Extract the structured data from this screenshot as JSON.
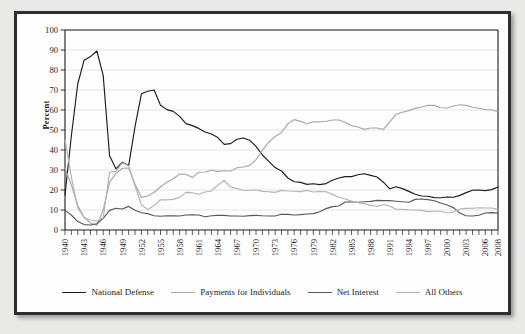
{
  "figure": {
    "y_axis_title": "Percent",
    "background_color": "#e9e9e7",
    "plate_color": "#ffffff",
    "frame_color": "#2e2e2e"
  },
  "legend": {
    "position": "bottom",
    "items": [
      {
        "label": "National Defense",
        "color": "#1d1d1d"
      },
      {
        "label": "Payments for Individuals",
        "color": "#a8a8a8"
      },
      {
        "label": "Net Interest",
        "color": "#595959"
      },
      {
        "label": "All Others",
        "color": "#b4b4b4"
      }
    ]
  },
  "chart_data": {
    "type": "line",
    "title": "",
    "subtitle": "",
    "xlabel": "",
    "ylabel": "Percent",
    "xlim": [
      1940,
      2008
    ],
    "ylim": [
      0,
      100
    ],
    "ytick_step": 10,
    "grid": true,
    "y_ticks": [
      0,
      10,
      20,
      30,
      40,
      50,
      60,
      70,
      80,
      90,
      100
    ],
    "x_tick_labels": [
      "1940",
      "1943",
      "1946",
      "1949",
      "1952",
      "1955",
      "1958",
      "1961",
      "1964",
      "1967",
      "1970",
      "1973",
      "1976",
      "1979",
      "1982",
      "1985",
      "1988",
      "1991",
      "1994",
      "1997",
      "2000",
      "2003",
      "2006",
      "2008"
    ],
    "x_minor_ticks_every_year": true,
    "x": [
      1940,
      1941,
      1942,
      1943,
      1944,
      1945,
      1946,
      1947,
      1948,
      1949,
      1950,
      1951,
      1952,
      1953,
      1954,
      1955,
      1956,
      1957,
      1958,
      1959,
      1960,
      1961,
      1962,
      1963,
      1964,
      1965,
      1966,
      1967,
      1968,
      1969,
      1970,
      1971,
      1972,
      1973,
      1974,
      1975,
      1976,
      1977,
      1978,
      1979,
      1980,
      1981,
      1982,
      1983,
      1984,
      1985,
      1986,
      1987,
      1988,
      1989,
      1990,
      1991,
      1992,
      1993,
      1994,
      1995,
      1996,
      1997,
      1998,
      1999,
      2000,
      2001,
      2002,
      2003,
      2004,
      2005,
      2006,
      2007,
      2008
    ],
    "series": [
      {
        "name": "National Defense",
        "color": "#1d1d1d",
        "values": [
          17.5,
          47.1,
          73.0,
          84.9,
          86.7,
          89.5,
          77.3,
          37.1,
          30.6,
          33.9,
          32.2,
          51.8,
          68.1,
          69.4,
          70.0,
          62.4,
          60.2,
          59.3,
          56.8,
          53.2,
          52.2,
          50.8,
          49.0,
          48.0,
          46.2,
          42.8,
          43.2,
          45.4,
          46.0,
          44.9,
          41.8,
          37.5,
          34.3,
          31.2,
          29.5,
          26.0,
          24.1,
          23.8,
          22.8,
          23.1,
          22.7,
          23.2,
          24.9,
          26.0,
          26.7,
          26.7,
          27.6,
          28.1,
          27.3,
          26.5,
          23.9,
          20.6,
          21.6,
          20.7,
          19.3,
          17.9,
          17.0,
          16.9,
          16.2,
          16.1,
          16.5,
          16.4,
          17.3,
          18.7,
          19.9,
          20.0,
          19.7,
          20.2,
          21.5
        ]
      },
      {
        "name": "Payments for Individuals",
        "color": "#a8a8a8",
        "values": [
          30.9,
          22.5,
          12.3,
          6.4,
          3.5,
          2.3,
          10.1,
          23.8,
          28.3,
          30.9,
          31.0,
          23.0,
          16.3,
          17.0,
          18.9,
          21.6,
          23.9,
          25.6,
          28.0,
          27.9,
          26.2,
          28.9,
          29.0,
          29.9,
          29.3,
          29.6,
          29.5,
          31.1,
          31.5,
          32.3,
          35.1,
          39.8,
          43.9,
          46.8,
          48.8,
          53.1,
          55.2,
          54.3,
          53.1,
          54.1,
          54.1,
          54.4,
          55.0,
          55.0,
          53.9,
          52.2,
          51.5,
          50.3,
          51.0,
          51.0,
          50.3,
          54.1,
          57.9,
          58.9,
          59.7,
          60.8,
          61.5,
          62.4,
          62.3,
          61.1,
          61.0,
          62.0,
          62.6,
          62.3,
          61.4,
          60.9,
          60.2,
          60.1,
          59.2
        ]
      },
      {
        "name": "Net Interest",
        "color": "#595959",
        "values": [
          9.8,
          7.5,
          4.2,
          2.7,
          2.5,
          3.1,
          5.8,
          9.8,
          10.9,
          10.5,
          11.8,
          9.9,
          8.6,
          8.2,
          7.1,
          6.9,
          7.1,
          7.1,
          7.0,
          7.5,
          7.6,
          7.5,
          6.6,
          7.1,
          7.3,
          7.3,
          7.0,
          7.0,
          6.9,
          7.2,
          7.3,
          7.1,
          7.0,
          7.0,
          7.9,
          7.8,
          7.5,
          7.7,
          8.0,
          8.2,
          9.1,
          10.7,
          11.7,
          12.0,
          14.0,
          14.1,
          13.9,
          14.1,
          14.3,
          14.8,
          14.7,
          14.7,
          14.4,
          14.1,
          13.9,
          15.3,
          15.5,
          15.2,
          14.6,
          13.5,
          12.5,
          11.2,
          8.5,
          7.1,
          7.0,
          7.4,
          8.5,
          8.7,
          8.5
        ]
      },
      {
        "name": "All Others",
        "color": "#b4b4b4",
        "values": [
          45.2,
          26.4,
          11.0,
          6.1,
          5.0,
          4.4,
          6.2,
          28.9,
          29.3,
          33.6,
          32.1,
          22.0,
          12.6,
          10.2,
          12.2,
          15.1,
          15.1,
          15.3,
          16.3,
          18.8,
          18.6,
          17.9,
          19.0,
          19.5,
          22.4,
          24.8,
          21.5,
          20.7,
          19.9,
          19.9,
          20.1,
          19.3,
          19.1,
          18.8,
          19.8,
          19.5,
          19.4,
          19.2,
          19.8,
          19.0,
          19.3,
          19.1,
          17.8,
          16.4,
          15.5,
          14.5,
          13.7,
          13.2,
          12.3,
          11.9,
          12.6,
          12.0,
          10.4,
          10.3,
          10.1,
          10.0,
          9.8,
          9.2,
          9.4,
          9.4,
          8.5,
          9.0,
          10.5,
          10.8,
          10.9,
          11.1,
          11.0,
          11.0,
          10.3
        ]
      }
    ]
  }
}
